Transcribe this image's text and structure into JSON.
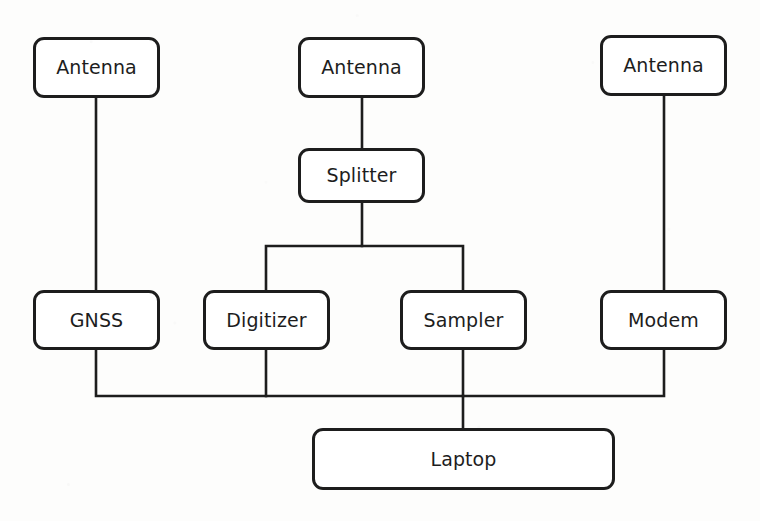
{
  "diagram": {
    "type": "block-diagram",
    "canvas": {
      "width": 760,
      "height": 521
    },
    "style": {
      "background_color": "#fdfdfc",
      "box_fill_color": "#ffffff",
      "line_color": "#1d1d1d",
      "text_color": "#1d1d1d",
      "box_stroke_width": 3,
      "wire_stroke_width": 2.6,
      "corner_radius": 11,
      "font_size": 19
    },
    "nodes": [
      {
        "id": "antenna-left",
        "label": "Antenna",
        "x": 33,
        "y": 37,
        "w": 127,
        "h": 61
      },
      {
        "id": "antenna-center",
        "label": "Antenna",
        "x": 298,
        "y": 37,
        "w": 127,
        "h": 61
      },
      {
        "id": "antenna-right",
        "label": "Antenna",
        "x": 600,
        "y": 35,
        "w": 127,
        "h": 61
      },
      {
        "id": "splitter",
        "label": "Splitter",
        "x": 298,
        "y": 148,
        "w": 127,
        "h": 55
      },
      {
        "id": "gnss",
        "label": "GNSS",
        "x": 33,
        "y": 290,
        "w": 127,
        "h": 60
      },
      {
        "id": "digitizer",
        "label": "Digitizer",
        "x": 203,
        "y": 290,
        "w": 127,
        "h": 60
      },
      {
        "id": "sampler",
        "label": "Sampler",
        "x": 400,
        "y": 290,
        "w": 127,
        "h": 60
      },
      {
        "id": "modem",
        "label": "Modem",
        "x": 600,
        "y": 290,
        "w": 127,
        "h": 60
      },
      {
        "id": "laptop",
        "label": "Laptop",
        "x": 312,
        "y": 428,
        "w": 303,
        "h": 62
      }
    ],
    "edges": [
      {
        "id": "antenna-left-to-gnss",
        "from": "antenna-left",
        "to": "gnss",
        "path": "M 96,98 L 96,290"
      },
      {
        "id": "antenna-center-to-splitter",
        "from": "antenna-center",
        "to": "splitter",
        "path": "M 362,98 L 362,148"
      },
      {
        "id": "splitter-to-digitizer",
        "from": "splitter",
        "to": "digitizer",
        "path": "M 362,203 L 362,246 L 266,246 L 266,290"
      },
      {
        "id": "splitter-to-sampler",
        "from": "splitter",
        "to": "sampler",
        "path": "M 362,246 L 463,246 L 463,290"
      },
      {
        "id": "antenna-right-to-modem",
        "from": "antenna-right",
        "to": "modem",
        "path": "M 664,96 L 664,290"
      },
      {
        "id": "gnss-to-bus",
        "from": "gnss",
        "to": "laptop",
        "path": "M 96,350 L 96,396 L 463,396"
      },
      {
        "id": "digitizer-to-bus",
        "from": "digitizer",
        "to": "laptop",
        "path": "M 266,350 L 266,396"
      },
      {
        "id": "modem-to-bus",
        "from": "modem",
        "to": "laptop",
        "path": "M 664,350 L 664,396 L 463,396"
      },
      {
        "id": "sampler-to-laptop",
        "from": "sampler",
        "to": "laptop",
        "path": "M 463,350 L 463,428"
      }
    ]
  }
}
